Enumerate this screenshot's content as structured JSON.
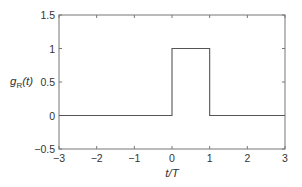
{
  "chart_data": {
    "type": "line",
    "title": "",
    "xlabel": "t/T",
    "ylabel": "g_R(t)",
    "ylabel_parts": {
      "main": "g",
      "sub": "R",
      "arg": "(t)"
    },
    "xlim": [
      -3,
      3
    ],
    "ylim": [
      -0.5,
      1.5
    ],
    "x_ticks": [
      -3,
      -2,
      -1,
      0,
      1,
      2,
      3
    ],
    "x_tick_labels": [
      "−3",
      "−2",
      "−1",
      "0",
      "1",
      "2",
      "3"
    ],
    "y_ticks": [
      -0.5,
      0,
      0.5,
      1,
      1.5
    ],
    "y_tick_labels": [
      "−0.5",
      "0",
      "0.5",
      "1",
      "1.5"
    ],
    "grid": false,
    "legend": "none",
    "series": [
      {
        "name": "g_R(t)",
        "color": "#555555",
        "x": [
          -3,
          0,
          0,
          1,
          1,
          3
        ],
        "y": [
          0,
          0,
          1,
          1,
          0,
          0
        ]
      }
    ]
  }
}
